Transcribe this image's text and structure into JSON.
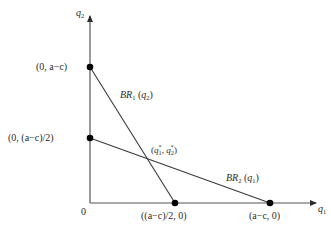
{
  "diagram": {
    "type": "best-response-functions",
    "axes": {
      "x_label": "q",
      "x_label_sub": "1",
      "y_label": "q",
      "y_label_sub": "2",
      "origin_label": "0"
    },
    "points": [
      {
        "id": "y_intercept_br1",
        "label": "(0, a−c)"
      },
      {
        "id": "y_intercept_br2",
        "label": "(0, (a−c)/2)"
      },
      {
        "id": "x_intercept_br1",
        "label": "((a−c)/2, 0)"
      },
      {
        "id": "x_intercept_br2",
        "label": "(a−c, 0)"
      }
    ],
    "lines": [
      {
        "id": "br1",
        "label_main": "BR",
        "label_sub": "1",
        "label_arg": "q",
        "label_arg_sub": "2"
      },
      {
        "id": "br2",
        "label_main": "BR",
        "label_sub": "2",
        "label_arg": "q",
        "label_arg_sub": "1"
      }
    ],
    "equilibrium": {
      "label_q1": "q",
      "label_q1_sub": "1",
      "label_q2": "q",
      "label_q2_sub": "2",
      "star": "*"
    },
    "colors": {
      "line": "#3a3a3a",
      "point": "#000000",
      "text": "#2b2b2b"
    }
  }
}
